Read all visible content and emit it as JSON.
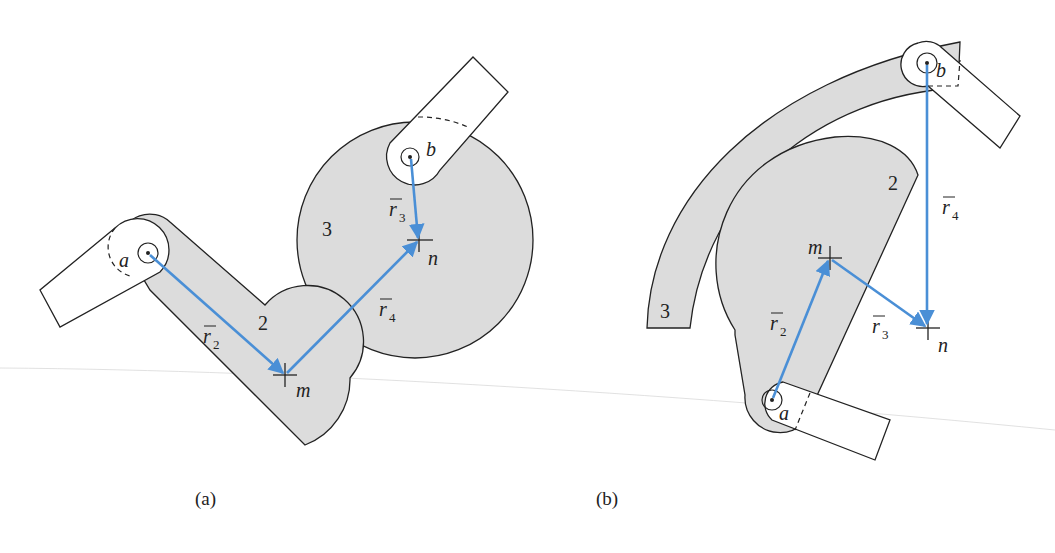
{
  "figure": {
    "panels": [
      {
        "id": "a",
        "caption": "(a)",
        "links": [
          {
            "label": "2"
          },
          {
            "label": "3"
          }
        ],
        "points": [
          {
            "label": "a"
          },
          {
            "label": "b"
          },
          {
            "label": "m"
          },
          {
            "label": "n"
          }
        ],
        "vectors": [
          {
            "name": "r",
            "sub": "2",
            "from": "a",
            "to": "m"
          },
          {
            "name": "r",
            "sub": "3",
            "from": "b",
            "to": "n"
          },
          {
            "name": "r",
            "sub": "4",
            "from": "m",
            "to": "n"
          }
        ]
      },
      {
        "id": "b",
        "caption": "(b)",
        "links": [
          {
            "label": "2"
          },
          {
            "label": "3"
          }
        ],
        "points": [
          {
            "label": "a"
          },
          {
            "label": "b"
          },
          {
            "label": "m"
          },
          {
            "label": "n"
          }
        ],
        "vectors": [
          {
            "name": "r",
            "sub": "2",
            "from": "a",
            "to": "m"
          },
          {
            "name": "r",
            "sub": "3",
            "from": "m",
            "to": "n"
          },
          {
            "name": "r",
            "sub": "4",
            "from": "b",
            "to": "n"
          }
        ]
      }
    ],
    "colors": {
      "vector": "#4a8fd6",
      "link_fill": "#dcdcdc",
      "outline": "#222222"
    }
  }
}
